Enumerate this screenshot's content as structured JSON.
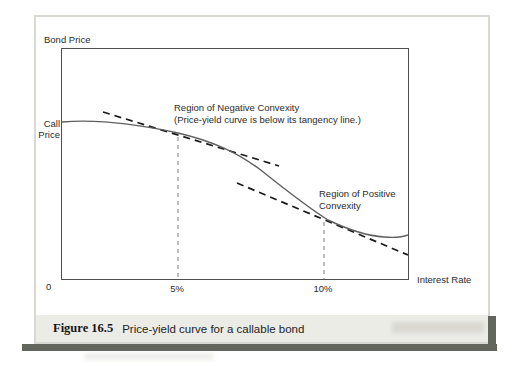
{
  "figure": {
    "caption": {
      "label": "Figure 16.5",
      "text": "Price-yield curve for a callable bond"
    }
  },
  "chart": {
    "y_axis_title": "Bond Price",
    "x_axis_title": "Interest Rate",
    "call_price_line1": "Call",
    "call_price_line2": "Price",
    "origin_label": "0",
    "tick_5": "5%",
    "tick_10": "10%",
    "annotation_negative_line1": "Region of Negative Convexity",
    "annotation_negative_line2": "(Price-yield curve is below its tangency line.)",
    "annotation_positive_line1": "Region of Positive",
    "annotation_positive_line2": "Convexity"
  },
  "chart_data": {
    "type": "line",
    "title": "Price-yield curve for a callable bond",
    "xlabel": "Interest Rate",
    "ylabel": "Bond Price",
    "x_ticks": [
      "0",
      "5%",
      "10%"
    ],
    "x_tick_positions_pct": [
      0,
      5,
      10
    ],
    "y_reference_line": {
      "label": "Call Price",
      "price_index": 100
    },
    "gridlines": "none",
    "legend": "none",
    "guide_lines": [
      {
        "at_x_pct": 5,
        "style": "dashed-gray-vertical",
        "from": "tangency point",
        "to": "x-axis"
      },
      {
        "at_x_pct": 10,
        "style": "dashed-gray-vertical",
        "from": "tangency point",
        "to": "x-axis"
      }
    ],
    "series": [
      {
        "name": "price-yield curve (callable bond)",
        "style": "solid",
        "x_rate_pct": [
          0,
          2.1,
          3.5,
          5,
          6.7,
          8.3,
          9.2,
          10,
          10.9,
          11.8,
          12.9
        ],
        "y_price_index": [
          100,
          99.4,
          96.2,
          93.6,
          80.1,
          56.4,
          44.2,
          37.8,
          30.1,
          26.9,
          28.2
        ]
      },
      {
        "name": "tangency line at 5% (negative convexity region)",
        "style": "dashed",
        "x_rate_pct": [
          1.8,
          8.5
        ],
        "y_price_index": [
          107.0,
          72.4
        ]
      },
      {
        "name": "tangency line at 10% (positive convexity region)",
        "style": "dashed",
        "x_rate_pct": [
          7.0,
          12.9
        ],
        "y_price_index": [
          61.5,
          15.4
        ]
      }
    ],
    "annotations": [
      {
        "text": "Region of Negative Convexity (Price-yield curve is below its tangency line.)",
        "near_x_pct": 5
      },
      {
        "text": "Region of Positive Convexity",
        "near_x_pct": 10
      }
    ]
  },
  "render": {
    "curve_path": "M 0,73 C 35,70 75,75 116,84 C 150,92 175,103 200,122 C 225,142 247,159 266,171 C 285,180 306,187 322,188 C 334,189 341,188 346,186",
    "tangent1_path": "M 41,63 L 217,117",
    "tangent2_path": "M 175,134 L 346,206",
    "guide5_path": "M 116,88 L 116,230",
    "guide10_path": "M 262,173 L 262,230",
    "colors": {
      "curve": "#5f5f5f",
      "tangent_dashed": "#1a1a1a",
      "guide_dashed": "#919191",
      "plot_frame": "#4f4f4f",
      "box_border": "#d9d9d4",
      "caption_background": "#ecece7",
      "drop_shadow": "#63665c"
    }
  }
}
